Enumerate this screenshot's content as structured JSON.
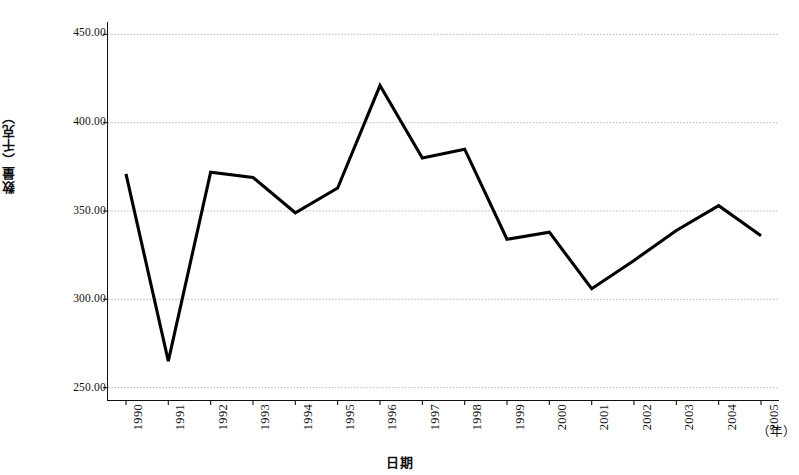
{
  "chart_data": {
    "type": "line",
    "title": "",
    "xlabel": "日期",
    "ylabel": "数量（千克）",
    "x_unit": "（年）",
    "categories": [
      "1990",
      "1991",
      "1992",
      "1993",
      "1994",
      "1995",
      "1996",
      "1997",
      "1998",
      "1999",
      "2000",
      "2001",
      "2002",
      "2003",
      "2004",
      "2005"
    ],
    "values": [
      371,
      265,
      372,
      369,
      349,
      363,
      421,
      380,
      385,
      334,
      338,
      306,
      322,
      339,
      353,
      336
    ],
    "series": [
      {
        "name": "数量",
        "values": [
          371,
          265,
          372,
          369,
          349,
          363,
          421,
          380,
          385,
          334,
          338,
          306,
          322,
          339,
          353,
          336
        ]
      }
    ],
    "ylim": [
      243,
      457
    ],
    "yticks": [
      250,
      300,
      350,
      400,
      450
    ],
    "ytick_labels": [
      "250.00",
      "300.00",
      "350.00",
      "400.00",
      "450.00"
    ],
    "grid": true,
    "grid_axis": "y",
    "legend": "none",
    "line_color": "#000000",
    "grid_color": "#aaaaaa",
    "axis_color": "#111111",
    "background_color": "#ffffff",
    "markers": false
  }
}
